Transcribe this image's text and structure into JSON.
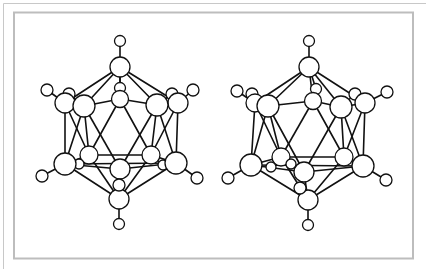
{
  "figure": {
    "colors": {
      "bond": "#111111",
      "atom_stroke": "#111111",
      "atom_fill": "#ffffff",
      "frame": "#bdbdbd"
    },
    "frame": {
      "outer": {
        "top_y": 3.5,
        "left_x": 3.5
      },
      "inner": {
        "x": 14,
        "y": 12.5,
        "w": 399,
        "h": 246
      }
    },
    "molecules": [
      {
        "name": "left-view",
        "atoms": [
          {
            "id": "Ht",
            "x": 120,
            "y": 41,
            "r": 5.5
          },
          {
            "id": "Bt",
            "x": 120,
            "y": 67,
            "r": 10
          },
          {
            "id": "Hbm",
            "x": 120,
            "y": 88,
            "r": 5.5
          },
          {
            "id": "Bm",
            "x": 120,
            "y": 99,
            "r": 8.5
          },
          {
            "id": "H1",
            "x": 47,
            "y": 90,
            "r": 6
          },
          {
            "id": "Hb1",
            "x": 69,
            "y": 94,
            "r": 6
          },
          {
            "id": "Bb1",
            "x": 65,
            "y": 103,
            "r": 10
          },
          {
            "id": "B1",
            "x": 84,
            "y": 106,
            "r": 11
          },
          {
            "id": "Hb2",
            "x": 172,
            "y": 94,
            "r": 6
          },
          {
            "id": "H2",
            "x": 193,
            "y": 90,
            "r": 6
          },
          {
            "id": "Bb2",
            "x": 178,
            "y": 103,
            "r": 10
          },
          {
            "id": "B2",
            "x": 157,
            "y": 105,
            "r": 11
          },
          {
            "id": "B3",
            "x": 65,
            "y": 164,
            "r": 11
          },
          {
            "id": "H3",
            "x": 42,
            "y": 176,
            "r": 6
          },
          {
            "id": "Bb3",
            "x": 89,
            "y": 155,
            "r": 9
          },
          {
            "id": "Hs3",
            "x": 79,
            "y": 164,
            "r": 5
          },
          {
            "id": "B4",
            "x": 176,
            "y": 163,
            "r": 11
          },
          {
            "id": "H4",
            "x": 197,
            "y": 178,
            "r": 6
          },
          {
            "id": "Bb4",
            "x": 151,
            "y": 155,
            "r": 9
          },
          {
            "id": "Hs4",
            "x": 163,
            "y": 165,
            "r": 5
          },
          {
            "id": "Bc",
            "x": 120,
            "y": 169,
            "r": 10
          },
          {
            "id": "Hc",
            "x": 119,
            "y": 185,
            "r": 6
          },
          {
            "id": "Bbot",
            "x": 119,
            "y": 199,
            "r": 10
          },
          {
            "id": "Hbot",
            "x": 119,
            "y": 224,
            "r": 5.5
          }
        ],
        "bonds": [
          [
            "Ht",
            "Bt"
          ],
          [
            "Bt",
            "Hbm"
          ],
          [
            "Bt",
            "B1"
          ],
          [
            "Bt",
            "B2"
          ],
          [
            "Bt",
            "Bb1"
          ],
          [
            "Bt",
            "Bb2"
          ],
          [
            "Bt",
            "Bm"
          ],
          [
            "H1",
            "Bb1"
          ],
          [
            "Hb1",
            "B1"
          ],
          [
            "H2",
            "Bb2"
          ],
          [
            "Hb2",
            "B2"
          ],
          [
            "B1",
            "Bm"
          ],
          [
            "Bm",
            "B2"
          ],
          [
            "Bb1",
            "B1"
          ],
          [
            "Bb2",
            "B2"
          ],
          [
            "Bb1",
            "B3"
          ],
          [
            "Bb2",
            "B4"
          ],
          [
            "B1",
            "B3"
          ],
          [
            "B2",
            "B4"
          ],
          [
            "B1",
            "Bc"
          ],
          [
            "B2",
            "Bc"
          ],
          [
            "Bm",
            "Bb3"
          ],
          [
            "Bm",
            "Bb4"
          ],
          [
            "B1",
            "Bb3"
          ],
          [
            "B2",
            "Bb4"
          ],
          [
            "Bb1",
            "Bb3"
          ],
          [
            "Bb2",
            "Bb4"
          ],
          [
            "B3",
            "Bb3"
          ],
          [
            "Bb3",
            "Bb4"
          ],
          [
            "Bb4",
            "B4"
          ],
          [
            "B3",
            "Bc"
          ],
          [
            "Bc",
            "B4"
          ],
          [
            "B3",
            "B4"
          ],
          [
            "H3",
            "B3"
          ],
          [
            "H4",
            "B4"
          ],
          [
            "Bb3",
            "Hs3"
          ],
          [
            "Bb4",
            "Hs4"
          ],
          [
            "B3",
            "Bbot"
          ],
          [
            "B4",
            "Bbot"
          ],
          [
            "Bc",
            "Bbot"
          ],
          [
            "Bb3",
            "Bbot"
          ],
          [
            "Bb4",
            "Bbot"
          ],
          [
            "Bc",
            "Hc"
          ],
          [
            "Bbot",
            "Hbot"
          ]
        ]
      },
      {
        "name": "right-view",
        "atoms": [
          {
            "id": "Ht",
            "x": 309,
            "y": 41,
            "r": 5.5
          },
          {
            "id": "Bt",
            "x": 309,
            "y": 67,
            "r": 10
          },
          {
            "id": "Hbm",
            "x": 316,
            "y": 89,
            "r": 5.5
          },
          {
            "id": "Bm",
            "x": 313,
            "y": 101,
            "r": 8.5
          },
          {
            "id": "H1",
            "x": 237,
            "y": 91,
            "r": 6
          },
          {
            "id": "Hb1",
            "x": 252,
            "y": 94,
            "r": 6
          },
          {
            "id": "Bb1",
            "x": 255,
            "y": 103,
            "r": 9
          },
          {
            "id": "B1",
            "x": 268,
            "y": 106,
            "r": 11
          },
          {
            "id": "Hb2",
            "x": 355,
            "y": 94,
            "r": 6
          },
          {
            "id": "H2",
            "x": 387,
            "y": 92,
            "r": 6
          },
          {
            "id": "Bb2",
            "x": 365,
            "y": 103,
            "r": 10
          },
          {
            "id": "B2",
            "x": 341,
            "y": 107,
            "r": 11
          },
          {
            "id": "B3",
            "x": 251,
            "y": 165,
            "r": 11
          },
          {
            "id": "H3",
            "x": 228,
            "y": 178,
            "r": 6
          },
          {
            "id": "Bb3",
            "x": 281,
            "y": 157,
            "r": 9
          },
          {
            "id": "Hs3",
            "x": 271,
            "y": 167,
            "r": 5
          },
          {
            "id": "B4",
            "x": 363,
            "y": 166,
            "r": 11
          },
          {
            "id": "H4",
            "x": 386,
            "y": 180,
            "r": 6
          },
          {
            "id": "Bb4",
            "x": 344,
            "y": 157,
            "r": 9
          },
          {
            "id": "Hs4",
            "x": 291,
            "y": 164,
            "r": 5
          },
          {
            "id": "Bc",
            "x": 304,
            "y": 172,
            "r": 10
          },
          {
            "id": "Hc",
            "x": 300,
            "y": 188,
            "r": 6
          },
          {
            "id": "Bbot",
            "x": 308,
            "y": 200,
            "r": 10
          },
          {
            "id": "Hbot",
            "x": 308,
            "y": 225,
            "r": 5.5
          }
        ],
        "bonds": [
          [
            "Ht",
            "Bt"
          ],
          [
            "Bt",
            "Hbm"
          ],
          [
            "Bt",
            "B1"
          ],
          [
            "Bt",
            "B2"
          ],
          [
            "Bt",
            "Bb1"
          ],
          [
            "Bt",
            "Bb2"
          ],
          [
            "Bt",
            "Bm"
          ],
          [
            "H1",
            "Bb1"
          ],
          [
            "Hb1",
            "B1"
          ],
          [
            "H2",
            "Bb2"
          ],
          [
            "Hb2",
            "B2"
          ],
          [
            "B1",
            "Bm"
          ],
          [
            "Bm",
            "B2"
          ],
          [
            "Bb1",
            "B1"
          ],
          [
            "Bb2",
            "B2"
          ],
          [
            "Bb1",
            "B3"
          ],
          [
            "Bb2",
            "B4"
          ],
          [
            "B1",
            "B3"
          ],
          [
            "B2",
            "B4"
          ],
          [
            "B1",
            "Bc"
          ],
          [
            "B2",
            "Bc"
          ],
          [
            "Bm",
            "Bb3"
          ],
          [
            "Bm",
            "Bb4"
          ],
          [
            "B1",
            "Bb3"
          ],
          [
            "B2",
            "Bb4"
          ],
          [
            "Bb1",
            "Bb3"
          ],
          [
            "Bb2",
            "Bb4"
          ],
          [
            "B3",
            "Bb3"
          ],
          [
            "Bb3",
            "Bb4"
          ],
          [
            "Bb4",
            "B4"
          ],
          [
            "B3",
            "Bc"
          ],
          [
            "Bc",
            "B4"
          ],
          [
            "B3",
            "B4"
          ],
          [
            "H3",
            "B3"
          ],
          [
            "H4",
            "B4"
          ],
          [
            "Bb3",
            "Hs3"
          ],
          [
            "Bb3",
            "Hs4"
          ],
          [
            "B3",
            "Bbot"
          ],
          [
            "B4",
            "Bbot"
          ],
          [
            "Bc",
            "Bbot"
          ],
          [
            "Bb3",
            "Bbot"
          ],
          [
            "Bb4",
            "Bbot"
          ],
          [
            "Bc",
            "Hc"
          ],
          [
            "Bbot",
            "Hbot"
          ]
        ]
      }
    ]
  }
}
